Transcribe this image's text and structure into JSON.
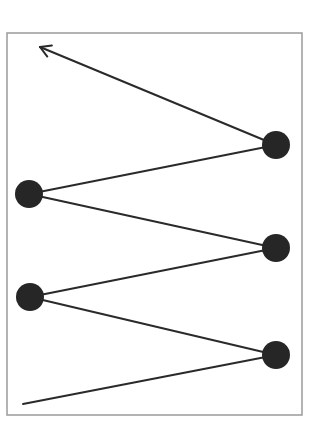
{
  "diagram": {
    "type": "zigzag-path",
    "frame": {
      "x": 7,
      "y": 33,
      "width": 295,
      "height": 382,
      "stroke": "#9a9a9a"
    },
    "line_color": "#2a2a2a",
    "node_color": "#262626",
    "node_radius": 14,
    "start_point": {
      "x": 23,
      "y": 404
    },
    "nodes": [
      {
        "id": "node-1",
        "x": 276,
        "y": 355
      },
      {
        "id": "node-2",
        "x": 30,
        "y": 297
      },
      {
        "id": "node-3",
        "x": 276,
        "y": 248
      },
      {
        "id": "node-4",
        "x": 29,
        "y": 194
      },
      {
        "id": "node-5",
        "x": 276,
        "y": 145
      }
    ],
    "end_arrow": {
      "x": 40,
      "y": 47,
      "direction": "up-left"
    }
  }
}
